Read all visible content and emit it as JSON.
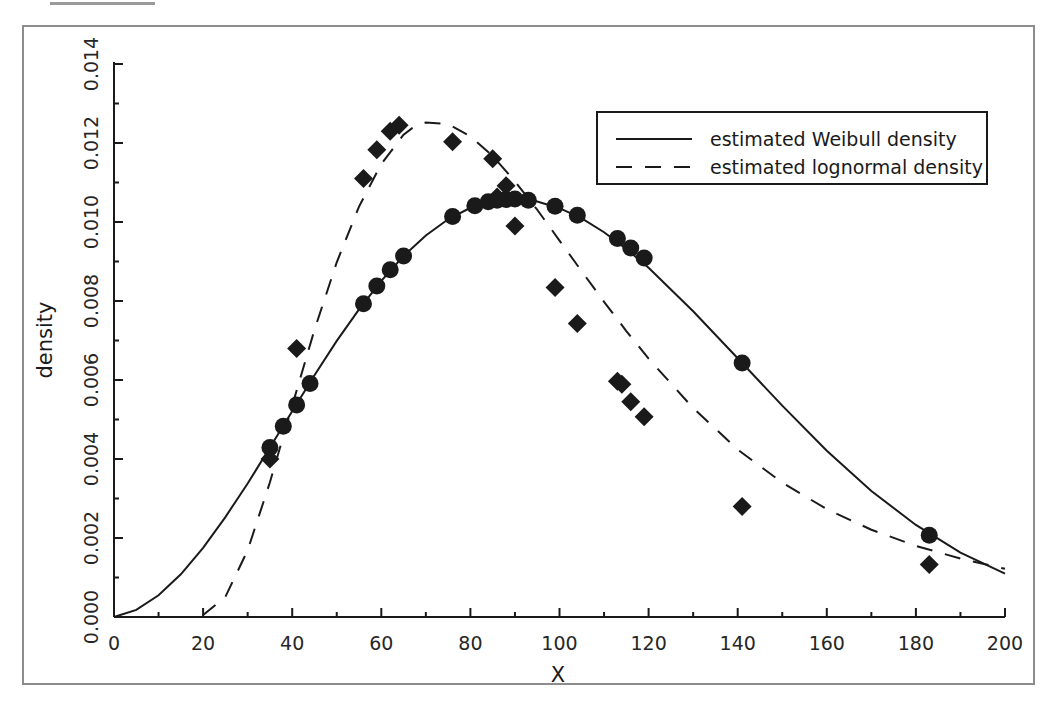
{
  "figure": {
    "background_color": "#ffffff",
    "frame_color": "#8d8d8d",
    "ink_color": "#1a1a1a"
  },
  "chart_data": {
    "type": "line",
    "title": "",
    "subtitle": "",
    "xlabel": "X",
    "ylabel": "density",
    "xlim": [
      0,
      200
    ],
    "ylim": [
      0.0,
      0.014
    ],
    "xticks": [
      0,
      20,
      40,
      60,
      80,
      100,
      120,
      140,
      160,
      180,
      200
    ],
    "xtick_labels": [
      "0",
      "20",
      "40",
      "60",
      "80",
      "100",
      "120",
      "140",
      "160",
      "180",
      "200"
    ],
    "x_minor_tick_step": 10,
    "yticks": [
      0.0,
      0.002,
      0.004,
      0.006,
      0.008,
      0.01,
      0.012,
      0.014
    ],
    "ytick_labels": [
      "0.000",
      "0.002",
      "0.004",
      "0.006",
      "0.008",
      "0.010",
      "0.012",
      "0.014"
    ],
    "y_minor_tick_step": 0.001,
    "grid": false,
    "legend_position": "upper right",
    "series": [
      {
        "name": "estimated Weibull density",
        "linestyle": "solid",
        "marker": "circle",
        "color": "#1a1a1a",
        "curve": [
          [
            0,
            0.0
          ],
          [
            5,
            0.00018
          ],
          [
            10,
            0.00055
          ],
          [
            15,
            0.00108
          ],
          [
            20,
            0.00175
          ],
          [
            25,
            0.00253
          ],
          [
            30,
            0.00338
          ],
          [
            35,
            0.00429
          ],
          [
            40,
            0.00521
          ],
          [
            45,
            0.00612
          ],
          [
            50,
            0.00699
          ],
          [
            55,
            0.00779
          ],
          [
            60,
            0.00851
          ],
          [
            65,
            0.00914
          ],
          [
            70,
            0.00966
          ],
          [
            75,
            0.01007
          ],
          [
            80,
            0.01036
          ],
          [
            85,
            0.01053
          ],
          [
            90,
            0.01058
          ],
          [
            95,
            0.01052
          ],
          [
            100,
            0.01035
          ],
          [
            105,
            0.01009
          ],
          [
            110,
            0.00974
          ],
          [
            115,
            0.00932
          ],
          [
            120,
            0.00884
          ],
          [
            130,
            0.00774
          ],
          [
            140,
            0.00655
          ],
          [
            150,
            0.00535
          ],
          [
            160,
            0.00421
          ],
          [
            170,
            0.00319
          ],
          [
            180,
            0.00233
          ],
          [
            190,
            0.00163
          ],
          [
            200,
            0.0011
          ]
        ],
        "points": [
          [
            35,
            0.00429
          ],
          [
            38,
            0.00483
          ],
          [
            41,
            0.00537
          ],
          [
            44,
            0.00591
          ],
          [
            56,
            0.00793
          ],
          [
            59,
            0.00838
          ],
          [
            62,
            0.00879
          ],
          [
            65,
            0.00914
          ],
          [
            76,
            0.01014
          ],
          [
            81,
            0.01041
          ],
          [
            84,
            0.01051
          ],
          [
            86,
            0.01055
          ],
          [
            88,
            0.01057
          ],
          [
            90,
            0.01058
          ],
          [
            93,
            0.01055
          ],
          [
            99,
            0.0104
          ],
          [
            104,
            0.01017
          ],
          [
            113,
            0.00958
          ],
          [
            116,
            0.00934
          ],
          [
            119,
            0.00909
          ],
          [
            141,
            0.00643
          ],
          [
            183,
            0.00207
          ]
        ]
      },
      {
        "name": "estimated lognormal density",
        "linestyle": "dashed",
        "marker": "diamond",
        "color": "#1a1a1a",
        "curve": [
          [
            20,
            5e-05
          ],
          [
            25,
            0.00051
          ],
          [
            30,
            0.00169
          ],
          [
            35,
            0.00341
          ],
          [
            40,
            0.00535
          ],
          [
            45,
            0.00727
          ],
          [
            50,
            0.00898
          ],
          [
            55,
            0.01039
          ],
          [
            60,
            0.01147
          ],
          [
            65,
            0.01221
          ],
          [
            67,
            0.01238
          ],
          [
            70,
            0.01252
          ],
          [
            75,
            0.01248
          ],
          [
            80,
            0.01217
          ],
          [
            85,
            0.01167
          ],
          [
            90,
            0.01103
          ],
          [
            95,
            0.01031
          ],
          [
            100,
            0.00953
          ],
          [
            105,
            0.00875
          ],
          [
            110,
            0.00798
          ],
          [
            115,
            0.00724
          ],
          [
            120,
            0.00654
          ],
          [
            130,
            0.00529
          ],
          [
            140,
            0.00424
          ],
          [
            150,
            0.0034
          ],
          [
            160,
            0.00273
          ],
          [
            170,
            0.00221
          ],
          [
            180,
            0.0018
          ],
          [
            190,
            0.00148
          ],
          [
            200,
            0.00122
          ]
        ],
        "points": [
          [
            35,
            0.004
          ],
          [
            41,
            0.0068
          ],
          [
            56,
            0.0111
          ],
          [
            59,
            0.01183
          ],
          [
            62,
            0.0123
          ],
          [
            64,
            0.01245
          ],
          [
            76,
            0.01203
          ],
          [
            85,
            0.0116
          ],
          [
            88,
            0.01092
          ],
          [
            86,
            0.01063
          ],
          [
            90,
            0.0099
          ],
          [
            99,
            0.00834
          ],
          [
            104,
            0.00743
          ],
          [
            113,
            0.00597
          ],
          [
            114,
            0.00589
          ],
          [
            116,
            0.00545
          ],
          [
            119,
            0.00507
          ],
          [
            141,
            0.0028
          ],
          [
            183,
            0.00133
          ]
        ]
      }
    ]
  }
}
